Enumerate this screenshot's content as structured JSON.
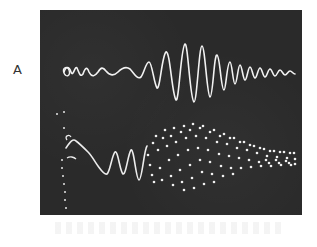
{
  "figure": {
    "panel_label": "A",
    "background_color": "#2a2a2a",
    "trace_color": "#f2f2f2"
  },
  "traces": [
    {
      "name": "upper-trace",
      "style": "continuous",
      "description": "Low-amplitude irregular start, large-amplitude oscillation burst at center, decaying to small high-frequency ripple"
    },
    {
      "name": "lower-trace",
      "style": "dotted",
      "description": "Continuous wave at start that grows in amplitude and breaks into a dotted, spread-out envelope that narrows toward the right"
    }
  ]
}
